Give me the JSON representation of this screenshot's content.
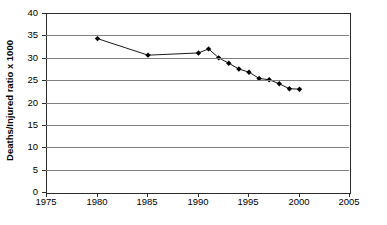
{
  "chart_data": {
    "type": "line",
    "title": "",
    "subtitle": "",
    "xlabel": "",
    "ylabel": "Deaths/Injured ratio x 1000",
    "xlim": [
      1975,
      2005
    ],
    "ylim": [
      0,
      40
    ],
    "xticks": [
      1975,
      1980,
      1985,
      1990,
      1995,
      2000,
      2005
    ],
    "yticks": [
      0,
      5,
      10,
      15,
      20,
      25,
      30,
      35,
      40
    ],
    "grid": "horizontal",
    "legend": "none",
    "marker": "diamond",
    "marker_color": "#000000",
    "line_color": "#000000",
    "gridline_color": "#808080",
    "frame_color": "#2b2b2b",
    "x": [
      1980,
      1985,
      1990,
      1991,
      1992,
      1993,
      1994,
      1995,
      1996,
      1997,
      1998,
      1999,
      2000
    ],
    "values": [
      34.5,
      30.8,
      31.3,
      32.2,
      30.2,
      29.0,
      27.7,
      27.0,
      25.6,
      25.3,
      24.4,
      23.3,
      23.2
    ],
    "series": [
      {
        "name": "Deaths/Injured ratio x 1000",
        "x": [
          1980,
          1985,
          1990,
          1991,
          1992,
          1993,
          1994,
          1995,
          1996,
          1997,
          1998,
          1999,
          2000
        ],
        "values": [
          34.5,
          30.8,
          31.3,
          32.2,
          30.2,
          29.0,
          27.7,
          27.0,
          25.6,
          25.3,
          24.4,
          23.3,
          23.2
        ]
      }
    ],
    "annotations": []
  }
}
